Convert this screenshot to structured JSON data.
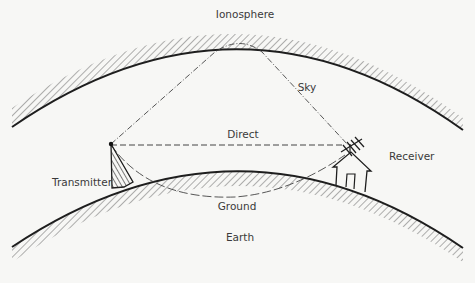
{
  "labels": {
    "ionosphere": "Ionosphere",
    "sky": "Sky",
    "direct": "Direct",
    "transmitter": "Transmitter",
    "receiver": "Receiver",
    "ground": "Ground",
    "earth": "Earth"
  },
  "colors": {
    "background": "#f7f7f5",
    "ink": "#1e1e1e",
    "hatch": "#555555",
    "text": "#3a3a3a"
  },
  "paths": [
    {
      "name": "sky",
      "style": "dash-dot",
      "from": "Transmitter",
      "via": "Ionosphere",
      "to": "Receiver"
    },
    {
      "name": "direct",
      "style": "dashed",
      "from": "Transmitter",
      "to": "Receiver"
    },
    {
      "name": "ground",
      "style": "long-dash",
      "from": "Transmitter",
      "via": "Earth surface",
      "to": "Receiver"
    }
  ]
}
